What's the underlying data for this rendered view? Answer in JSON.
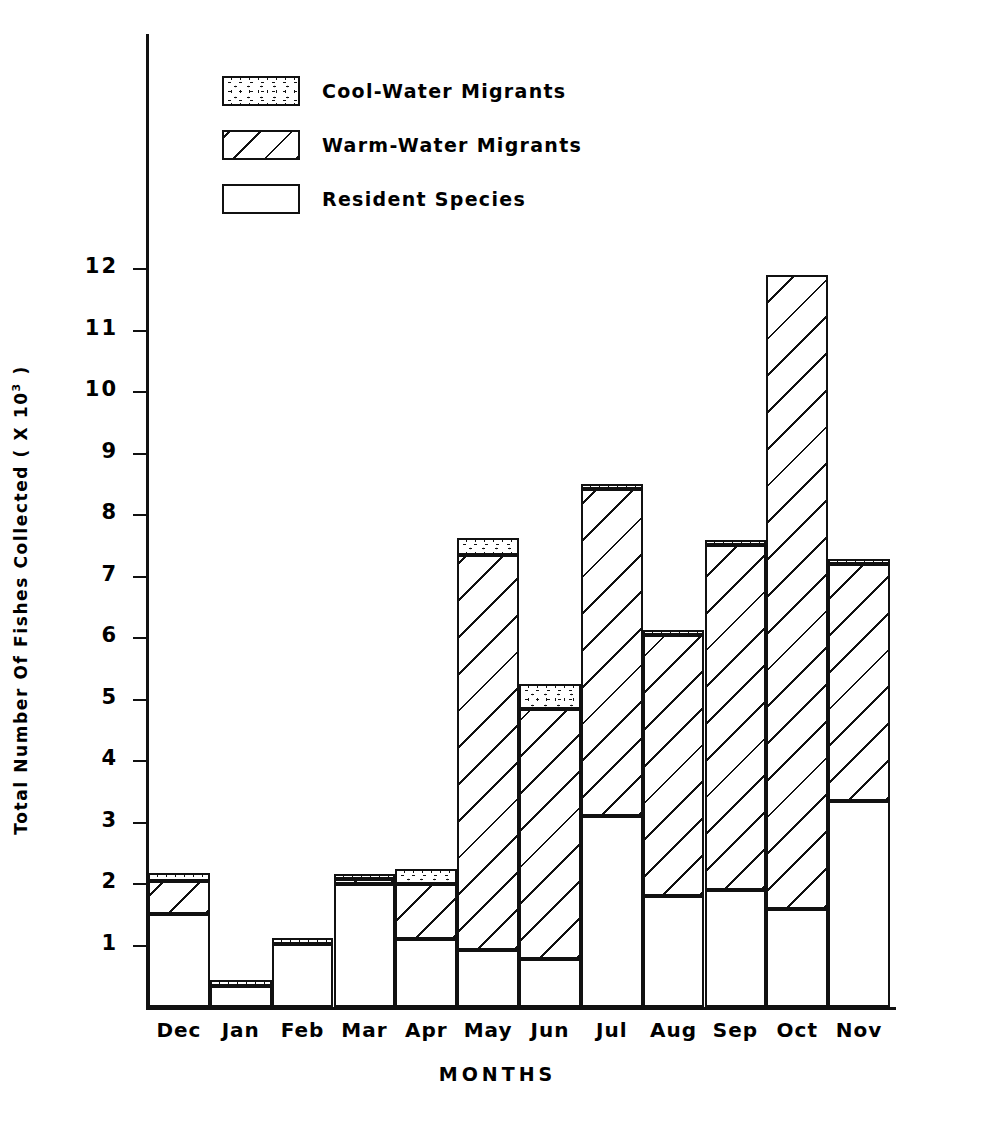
{
  "chart_data": {
    "type": "bar",
    "subtype": "stacked",
    "title": "",
    "xlabel": "MONTHS",
    "ylabel": "Total Number Of Fishes Collected ( X 10³ )",
    "ylabel_prefix": "Total Number Of Fishes Collected ( X 10",
    "ylabel_exponent": "3",
    "ylabel_suffix": " )",
    "ylim": [
      0,
      12.6
    ],
    "yticks": [
      1,
      2,
      3,
      4,
      5,
      6,
      7,
      8,
      9,
      10,
      11,
      12
    ],
    "ytick_labels": [
      "1",
      "2",
      "3",
      "4",
      "5",
      "6",
      "7",
      "8",
      "9",
      "10",
      "11",
      "12"
    ],
    "grid": false,
    "legend_position": "upper-left-inside",
    "categories": [
      "Dec",
      "Jan",
      "Feb",
      "Mar",
      "Apr",
      "May",
      "Jun",
      "Jul",
      "Aug",
      "Sep",
      "Oct",
      "Nov"
    ],
    "series": [
      {
        "name": "Resident Species",
        "pattern": "blank",
        "values": [
          1.52,
          0.34,
          1.02,
          2.0,
          1.1,
          0.92,
          0.78,
          3.1,
          1.8,
          1.9,
          1.6,
          3.35
        ]
      },
      {
        "name": "Warm-Water Migrants",
        "pattern": "diagonal-hatch",
        "values": [
          0.53,
          0.0,
          0.0,
          0.08,
          0.9,
          6.43,
          4.07,
          5.32,
          4.25,
          5.62,
          10.3,
          3.85
        ]
      },
      {
        "name": "Cool-Water Migrants",
        "pattern": "stipple",
        "values": [
          0.13,
          0.1,
          0.1,
          0.07,
          0.25,
          0.28,
          0.4,
          0.05,
          0.07,
          0.05,
          0.0,
          0.05
        ]
      }
    ],
    "totals": [
      2.18,
      0.44,
      1.12,
      2.15,
      2.25,
      7.63,
      5.25,
      8.47,
      6.12,
      7.57,
      11.9,
      7.25
    ]
  },
  "legend": {
    "items": [
      {
        "label": "Cool-Water Migrants",
        "pattern": "cool"
      },
      {
        "label": "Warm-Water Migrants",
        "pattern": "warm"
      },
      {
        "label": "Resident Species",
        "pattern": "resident"
      }
    ]
  },
  "colors": {
    "ink": "#111111",
    "background": "#ffffff"
  }
}
